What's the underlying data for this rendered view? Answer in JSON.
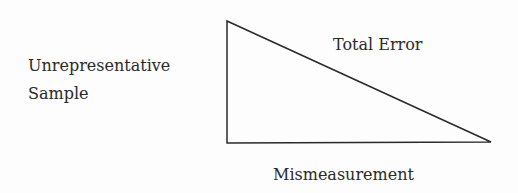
{
  "diagram": {
    "shape": "right-triangle",
    "line_color": "#2a2a2a",
    "labels": {
      "left_line1": "Unrepresentative",
      "left_line2": "Sample",
      "hypotenuse": "Total Error",
      "bottom": "Mismeasurement"
    }
  }
}
